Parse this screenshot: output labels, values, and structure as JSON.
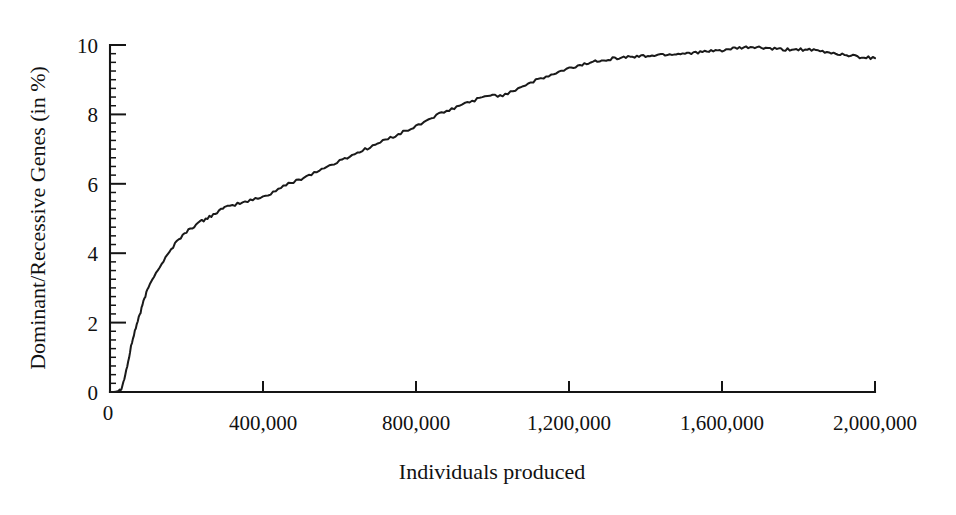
{
  "chart_data": {
    "type": "line",
    "title": "",
    "xlabel": "Individuals produced",
    "ylabel": "Dominant/Recessive  Genes (in %)",
    "xlim": [
      0,
      2000000
    ],
    "ylim": [
      0,
      10
    ],
    "grid": false,
    "legend": null,
    "xticks": [
      0,
      400000,
      800000,
      1200000,
      1600000,
      2000000
    ],
    "xtick_labels": [
      "0",
      "400,000",
      "800,000",
      "1,200,000",
      "1,600,000",
      "2,000,000"
    ],
    "yticks": [
      0,
      2,
      4,
      6,
      8,
      10
    ],
    "ytick_labels": [
      "0",
      "2",
      "4",
      "6",
      "8",
      "10"
    ],
    "y_minor_tick_step": 0.25,
    "series": [
      {
        "name": "Dominant/Recessive Genes",
        "color": "#1a1a1a",
        "x": [
          0,
          10000,
          20000,
          25000,
          30000,
          35000,
          40000,
          45000,
          50000,
          55000,
          60000,
          65000,
          70000,
          75000,
          80000,
          85000,
          90000,
          95000,
          100000,
          110000,
          120000,
          130000,
          140000,
          150000,
          160000,
          170000,
          180000,
          190000,
          200000,
          210000,
          220000,
          230000,
          240000,
          250000,
          260000,
          270000,
          280000,
          290000,
          300000,
          320000,
          340000,
          360000,
          380000,
          400000,
          420000,
          440000,
          460000,
          480000,
          500000,
          520000,
          540000,
          560000,
          580000,
          600000,
          620000,
          640000,
          660000,
          680000,
          700000,
          720000,
          740000,
          760000,
          780000,
          800000,
          820000,
          840000,
          860000,
          880000,
          900000,
          920000,
          940000,
          960000,
          980000,
          1000000,
          1020000,
          1040000,
          1060000,
          1080000,
          1100000,
          1120000,
          1140000,
          1160000,
          1180000,
          1200000,
          1240000,
          1280000,
          1320000,
          1360000,
          1400000,
          1440000,
          1480000,
          1520000,
          1560000,
          1600000,
          1640000,
          1680000,
          1720000,
          1760000,
          1800000,
          1840000,
          1880000,
          1920000,
          1960000,
          2000000
        ],
        "y": [
          0,
          0,
          0.02,
          0.05,
          0.12,
          0.28,
          0.5,
          0.75,
          1.0,
          1.3,
          1.55,
          1.75,
          1.95,
          2.15,
          2.3,
          2.5,
          2.7,
          2.85,
          3.0,
          3.25,
          3.45,
          3.6,
          3.78,
          3.95,
          4.1,
          4.28,
          4.42,
          4.5,
          4.62,
          4.7,
          4.78,
          4.86,
          4.92,
          4.98,
          5.05,
          5.12,
          5.18,
          5.25,
          5.3,
          5.38,
          5.44,
          5.5,
          5.56,
          5.62,
          5.72,
          5.85,
          5.96,
          6.06,
          6.15,
          6.25,
          6.35,
          6.45,
          6.55,
          6.65,
          6.76,
          6.86,
          6.96,
          7.06,
          7.16,
          7.26,
          7.36,
          7.46,
          7.55,
          7.65,
          7.78,
          7.9,
          8.0,
          8.08,
          8.18,
          8.28,
          8.36,
          8.44,
          8.5,
          8.58,
          8.52,
          8.62,
          8.72,
          8.82,
          8.92,
          9.0,
          9.08,
          9.16,
          9.24,
          9.32,
          9.45,
          9.56,
          9.62,
          9.66,
          9.68,
          9.72,
          9.74,
          9.78,
          9.8,
          9.85,
          9.9,
          9.94,
          9.9,
          9.86,
          9.88,
          9.84,
          9.78,
          9.72,
          9.66,
          9.62
        ]
      }
    ]
  },
  "figure": {
    "background_color": "#ffffff",
    "line_color": "#1a1a1a",
    "axis_color": "#151515"
  }
}
